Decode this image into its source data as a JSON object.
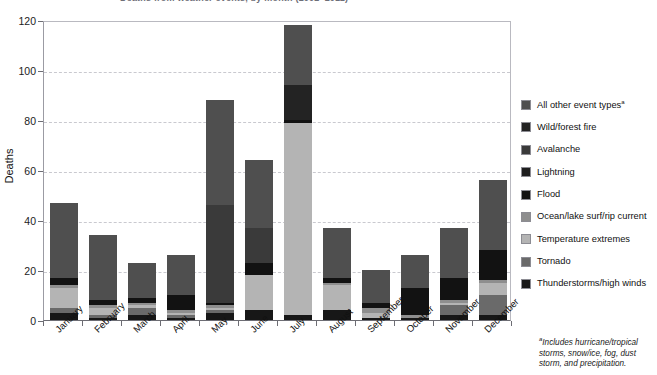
{
  "title": "Deaths from weather events, by month (2002–2011)",
  "chart_data": {
    "type": "bar",
    "stacked": true,
    "title": "Deaths from weather events, by month (2002–2011)",
    "xlabel": "",
    "ylabel": "Deaths",
    "ylim": [
      0,
      120
    ],
    "yticks": [
      0,
      20,
      40,
      60,
      80,
      100,
      120
    ],
    "grid": "horizontal-dashed",
    "legend_position": "right",
    "categories": [
      "January",
      "February",
      "March",
      "April",
      "May",
      "June",
      "July",
      "August",
      "September",
      "October",
      "November",
      "December"
    ],
    "series": [
      {
        "name": "Thunderstorms/high winds",
        "color": "#171717",
        "values": [
          3,
          1,
          2,
          1,
          3,
          4,
          2,
          4,
          1,
          1,
          2,
          2
        ]
      },
      {
        "name": "Tornado",
        "color": "#6a6a6a",
        "values": [
          2,
          1,
          3,
          1,
          1,
          0,
          0,
          0,
          0,
          0,
          4,
          8
        ]
      },
      {
        "name": "Temperature extremes",
        "color": "#b4b4b4",
        "values": [
          8,
          3,
          1,
          1,
          1,
          14,
          77,
          10,
          2,
          0,
          1,
          5
        ]
      },
      {
        "name": "Ocean/lake surf/rip current",
        "color": "#8e8e8e",
        "values": [
          1,
          1,
          1,
          1,
          1,
          0,
          0,
          1,
          2,
          1,
          1,
          1
        ]
      },
      {
        "name": "Flood",
        "color": "#121212",
        "values": [
          3,
          2,
          2,
          6,
          1,
          5,
          1,
          2,
          2,
          11,
          9,
          12
        ]
      },
      {
        "name": "Lightning",
        "color": "#1e1e1e",
        "values": [
          0,
          0,
          0,
          0,
          0,
          0,
          0,
          0,
          0,
          0,
          0,
          0
        ]
      },
      {
        "name": "Avalanche",
        "color": "#3a3a3a",
        "values": [
          0,
          0,
          0,
          0,
          39,
          14,
          0,
          0,
          0,
          0,
          0,
          0
        ]
      },
      {
        "name": "Wild/forest fire",
        "color": "#232323",
        "values": [
          0,
          0,
          0,
          0,
          0,
          0,
          14,
          0,
          0,
          0,
          0,
          0
        ]
      },
      {
        "name": "All other event types",
        "color": "#4f4f4f",
        "values": [
          30,
          26,
          14,
          16,
          42,
          27,
          24,
          20,
          13,
          13,
          20,
          28
        ]
      }
    ],
    "totals": [
      47,
      34,
      23,
      26,
      88,
      64,
      118,
      37,
      20,
      26,
      37,
      56
    ]
  },
  "axis": {
    "y_label": "Deaths",
    "y_ticks": [
      "0",
      "20",
      "40",
      "60",
      "80",
      "100",
      "120"
    ],
    "x_labels": [
      "January",
      "February",
      "March",
      "April",
      "May",
      "June",
      "July",
      "August",
      "September",
      "October",
      "November",
      "December"
    ]
  },
  "legend": {
    "items": [
      {
        "label": "All other event types",
        "superscript": "a",
        "color": "#4f4f4f"
      },
      {
        "label": "Wild/forest fire",
        "superscript": "",
        "color": "#232323"
      },
      {
        "label": "Avalanche",
        "superscript": "",
        "color": "#3a3a3a"
      },
      {
        "label": "Lightning",
        "superscript": "",
        "color": "#1e1e1e"
      },
      {
        "label": "Flood",
        "superscript": "",
        "color": "#121212"
      },
      {
        "label": "Ocean/lake surf/rip current",
        "superscript": "",
        "color": "#8e8e8e"
      },
      {
        "label": "Temperature extremes",
        "superscript": "",
        "color": "#b4b4b4"
      },
      {
        "label": "Tornado",
        "superscript": "",
        "color": "#6a6a6a"
      },
      {
        "label": "Thunderstorms/high winds",
        "superscript": "",
        "color": "#171717"
      }
    ]
  },
  "footnote": {
    "marker": "a",
    "text": "Includes hurricane/tropical storms, snow/ice, fog, dust storm, and precipitation."
  }
}
